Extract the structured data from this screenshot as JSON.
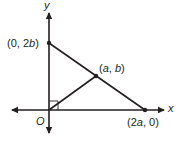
{
  "diagram": {
    "type": "coordinate-geometry",
    "axes": {
      "x_label": "x",
      "y_label": "y",
      "origin_label": "O"
    },
    "points": [
      {
        "id": "A",
        "label": "(0, 2b)",
        "parts": [
          "(0, 2",
          "b",
          ")"
        ]
      },
      {
        "id": "M",
        "label": "(a, b)",
        "parts": [
          "(",
          "a",
          ", ",
          "b",
          ")"
        ]
      },
      {
        "id": "B",
        "label": "(2a, 0)",
        "parts": [
          "(2",
          "a",
          ", 0)"
        ]
      }
    ],
    "segments": [
      {
        "from": "(0, 2b)",
        "to": "(2a, 0)"
      },
      {
        "from": "O",
        "to": "(a, b)"
      }
    ],
    "right_angle_marker": "at origin O",
    "colors": {
      "ink": "#231f20",
      "background": "#ffffff"
    }
  }
}
